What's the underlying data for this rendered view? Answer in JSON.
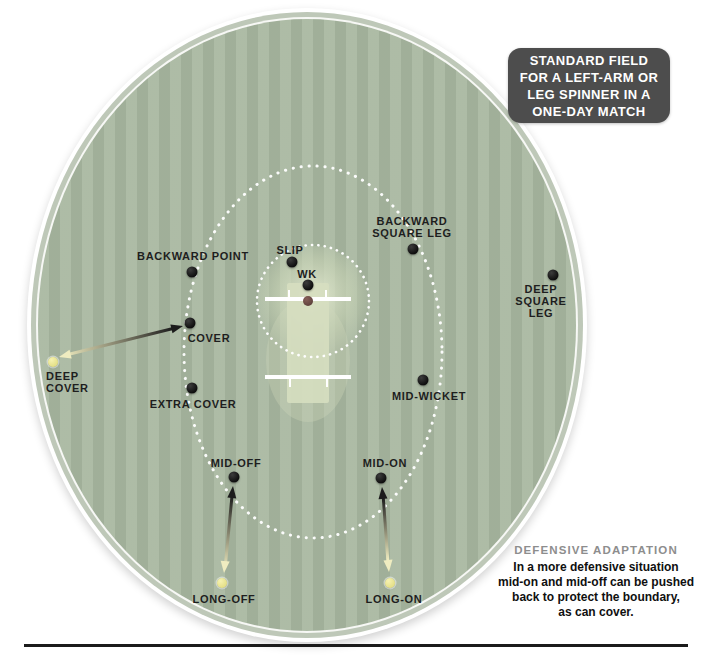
{
  "title_box": {
    "lines": [
      "STANDARD FIELD",
      "FOR A LEFT-ARM OR",
      "LEG SPINNER IN A",
      "ONE-DAY MATCH"
    ]
  },
  "adaptation_note": {
    "heading": "DEFENSIVE ADAPTATION",
    "lines": [
      "In a more defensive situation",
      "mid-on and mid-off can be pushed",
      "back to protect the boundary,",
      "as can cover."
    ]
  },
  "positions": [
    {
      "name": "slip",
      "label_lines": [
        "SLIP"
      ],
      "type": "standard",
      "dot": {
        "x": 292,
        "y": 262
      },
      "label": {
        "x": 290,
        "y": 244,
        "align": "center"
      }
    },
    {
      "name": "wk",
      "label_lines": [
        "WK"
      ],
      "type": "standard",
      "dot": {
        "x": 308,
        "y": 285
      },
      "label": {
        "x": 307,
        "y": 268,
        "align": "center"
      }
    },
    {
      "name": "batsman",
      "label_lines": [],
      "type": "batsman",
      "dot": {
        "x": 308,
        "y": 301
      },
      "label": null
    },
    {
      "name": "backward-point",
      "label_lines": [
        "BACKWARD POINT"
      ],
      "type": "standard",
      "dot": {
        "x": 192,
        "y": 272
      },
      "label": {
        "x": 193,
        "y": 250,
        "align": "center"
      }
    },
    {
      "name": "cover",
      "label_lines": [
        "COVER"
      ],
      "type": "standard",
      "dot": {
        "x": 190,
        "y": 323
      },
      "label": {
        "x": 209,
        "y": 332,
        "align": "center"
      }
    },
    {
      "name": "extra-cover",
      "label_lines": [
        "EXTRA COVER"
      ],
      "type": "standard",
      "dot": {
        "x": 192,
        "y": 388
      },
      "label": {
        "x": 193,
        "y": 398,
        "align": "center"
      }
    },
    {
      "name": "deep-cover",
      "label_lines": [
        "DEEP",
        "COVER"
      ],
      "type": "defensive",
      "dot": {
        "x": 53,
        "y": 362
      },
      "label": {
        "x": 46,
        "y": 370,
        "align": "left"
      }
    },
    {
      "name": "mid-off",
      "label_lines": [
        "MID-OFF"
      ],
      "type": "standard",
      "dot": {
        "x": 234,
        "y": 477
      },
      "label": {
        "x": 236,
        "y": 457,
        "align": "center"
      }
    },
    {
      "name": "long-off",
      "label_lines": [
        "LONG-OFF"
      ],
      "type": "defensive",
      "dot": {
        "x": 222,
        "y": 583
      },
      "label": {
        "x": 224,
        "y": 593,
        "align": "center"
      }
    },
    {
      "name": "mid-on",
      "label_lines": [
        "MID-ON"
      ],
      "type": "standard",
      "dot": {
        "x": 381,
        "y": 478
      },
      "label": {
        "x": 385,
        "y": 457,
        "align": "center"
      }
    },
    {
      "name": "long-on",
      "label_lines": [
        "LONG-ON"
      ],
      "type": "defensive",
      "dot": {
        "x": 390,
        "y": 583
      },
      "label": {
        "x": 394,
        "y": 593,
        "align": "center"
      }
    },
    {
      "name": "mid-wicket",
      "label_lines": [
        "MID-WICKET"
      ],
      "type": "standard",
      "dot": {
        "x": 423,
        "y": 380
      },
      "label": {
        "x": 429,
        "y": 390,
        "align": "center"
      }
    },
    {
      "name": "backward-square-leg",
      "label_lines": [
        "BACKWARD",
        "SQUARE LEG"
      ],
      "type": "standard",
      "dot": {
        "x": 413,
        "y": 249
      },
      "label": {
        "x": 412,
        "y": 215,
        "align": "center"
      }
    },
    {
      "name": "deep-square-leg",
      "label_lines": [
        "DEEP",
        "SQUARE",
        "LEG"
      ],
      "type": "standard",
      "dot": {
        "x": 553,
        "y": 275
      },
      "label": {
        "x": 541,
        "y": 283,
        "align": "center"
      }
    }
  ],
  "adaptation_arrows": [
    {
      "from": "deep-cover",
      "to": "cover"
    },
    {
      "from": "long-off",
      "to": "mid-off"
    },
    {
      "from": "long-on",
      "to": "mid-on"
    }
  ],
  "colors": {
    "field_green": "#a9b8a1",
    "boundary_ring": "#ffffff",
    "inner_circle_dots": "#ffffff",
    "standard_dot": "#141414",
    "defensive_dot": "#ece897",
    "batsman_dot": "#6d4b44",
    "title_box_bg": "#4d4d4d",
    "title_text": "#ffffff",
    "note_heading": "#8d8d8d",
    "note_text": "#101010",
    "arrow_dark_end": "#1c1c1c",
    "arrow_light_end": "#efecc0"
  }
}
